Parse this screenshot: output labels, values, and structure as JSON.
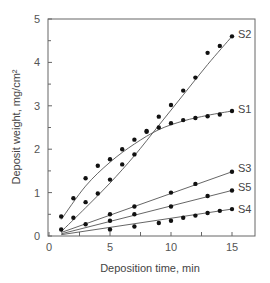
{
  "chart_data": {
    "type": "scatter",
    "title": "",
    "xlabel": "Deposition time, min",
    "ylabel": "Deposit weight, mg/cm²",
    "xlim": [
      0,
      15.5
    ],
    "ylim": [
      0,
      5
    ],
    "xticks": [
      0,
      5,
      10,
      15
    ],
    "yticks": [
      0,
      1,
      2,
      3,
      4,
      5
    ],
    "grid": false,
    "legend": "inline labels at line ends",
    "series": [
      {
        "name": "S2",
        "x": [
          1,
          2,
          3,
          4,
          5,
          6,
          7,
          8,
          9,
          10,
          11,
          12,
          13,
          14,
          15
        ],
        "values": [
          0.15,
          0.42,
          0.78,
          0.98,
          1.3,
          1.65,
          1.88,
          2.42,
          2.75,
          3.02,
          3.35,
          3.65,
          4.22,
          4.38,
          4.6
        ],
        "fit": [
          [
            1,
            0.1
          ],
          [
            3,
            0.65
          ],
          [
            5,
            1.22
          ],
          [
            7,
            1.85
          ],
          [
            9,
            2.55
          ],
          [
            11,
            3.25
          ],
          [
            13,
            3.95
          ],
          [
            15,
            4.6
          ]
        ]
      },
      {
        "name": "S1",
        "x": [
          1,
          2,
          3,
          4,
          5,
          6,
          7,
          8,
          9,
          10,
          11,
          12,
          13,
          14,
          15
        ],
        "values": [
          0.45,
          0.87,
          1.33,
          1.62,
          1.77,
          2.0,
          2.22,
          2.4,
          2.5,
          2.6,
          2.67,
          2.72,
          2.76,
          2.8,
          2.88
        ],
        "fit": [
          [
            1,
            0.38
          ],
          [
            3,
            1.15
          ],
          [
            5,
            1.7
          ],
          [
            7,
            2.12
          ],
          [
            9,
            2.45
          ],
          [
            11,
            2.65
          ],
          [
            13,
            2.78
          ],
          [
            15,
            2.88
          ]
        ]
      },
      {
        "name": "S3",
        "x": [
          3,
          5,
          7,
          10,
          12,
          15
        ],
        "values": [
          0.27,
          0.5,
          0.68,
          1.0,
          1.2,
          1.48
        ],
        "fit": [
          [
            1,
            0.08
          ],
          [
            15,
            1.48
          ]
        ]
      },
      {
        "name": "S5",
        "x": [
          5,
          7,
          10,
          13,
          15
        ],
        "values": [
          0.35,
          0.5,
          0.68,
          0.92,
          1.05
        ],
        "fit": [
          [
            1,
            0.05
          ],
          [
            15,
            1.05
          ]
        ]
      },
      {
        "name": "S4",
        "x": [
          5,
          7,
          9,
          10,
          11,
          12,
          13,
          14,
          15
        ],
        "values": [
          0.15,
          0.22,
          0.3,
          0.35,
          0.42,
          0.47,
          0.53,
          0.58,
          0.62
        ],
        "fit": [
          [
            1,
            0.03
          ],
          [
            15,
            0.62
          ]
        ]
      }
    ]
  }
}
